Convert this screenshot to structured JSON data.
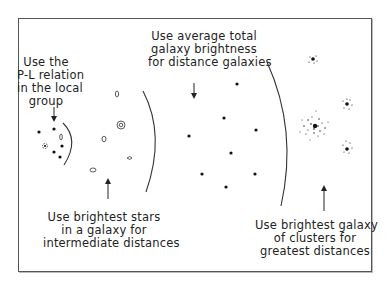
{
  "diagram": {
    "colors": {
      "ink": "#222222",
      "frame": "#555555",
      "background": "#ffffff"
    },
    "labels": {
      "local_group": "Use the\nP-L relation\nin the local\ngroup",
      "brightest_stars": "Use brightest stars\nin a galaxy for\nintermediate distances",
      "average_brightness": "Use average total\ngalaxy brightness\nfor distance galaxies",
      "brightest_cluster_galaxy": "Use brightest galaxy\nof clusters for\ngreatest distances"
    },
    "regions": [
      {
        "name": "local-group",
        "method": "P-L relation",
        "arrow": "down"
      },
      {
        "name": "intermediate",
        "method": "brightest stars",
        "arrow": "up"
      },
      {
        "name": "distant",
        "method": "average total galaxy brightness",
        "arrow": "down"
      },
      {
        "name": "greatest",
        "method": "brightest galaxy of clusters",
        "arrow": "up"
      }
    ]
  }
}
